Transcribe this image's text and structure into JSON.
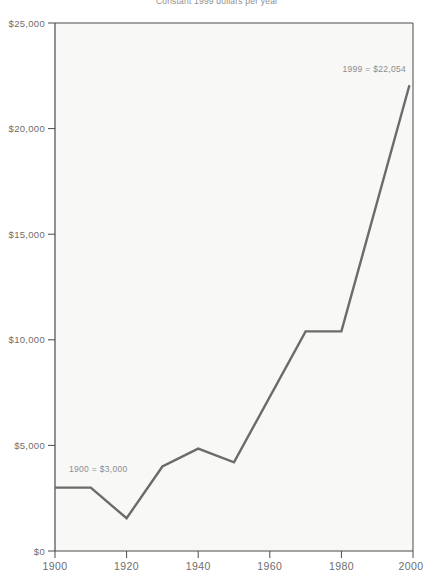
{
  "chart_data": {
    "type": "line",
    "title": "Constant 1999 dollars per year",
    "xlabel": "",
    "ylabel": "",
    "x": [
      1900,
      1910,
      1920,
      1930,
      1940,
      1950,
      1970,
      1980,
      1999
    ],
    "values": [
      3000,
      3000,
      1550,
      4000,
      4850,
      4200,
      10400,
      10400,
      22054
    ],
    "series": [
      {
        "name": "Constant 1999 dollars",
        "values": [
          3000,
          3000,
          1550,
          4000,
          4850,
          4200,
          10400,
          10400,
          22054
        ]
      }
    ],
    "xlim": [
      1900,
      2000
    ],
    "ylim": [
      0,
      25000
    ],
    "xticks": [
      1900,
      1920,
      1940,
      1960,
      1980,
      2000
    ],
    "xtick_labels": [
      "1900",
      "1920",
      "1940",
      "1960",
      "1980",
      "2000"
    ],
    "yticks": [
      0,
      5000,
      10000,
      15000,
      20000,
      25000
    ],
    "ytick_labels": [
      "$0",
      "$5,000",
      "$10,000",
      "$15,000",
      "$20,000",
      "$25,000"
    ],
    "grid": false,
    "legend": "none",
    "annotations": [
      {
        "name": "start-value",
        "text": "1900  =  $3,000",
        "x": 1900,
        "y": 3000
      },
      {
        "name": "end-value",
        "text": "1999  =  $22,054",
        "x": 1999,
        "y": 22054
      }
    ],
    "colors": {
      "line": "#6b6b6b",
      "axis": "#4a4a4a",
      "plot_background": "#f8f8f7",
      "text": "#6e6e6e",
      "annotation_text": "#8c8c8c"
    }
  }
}
